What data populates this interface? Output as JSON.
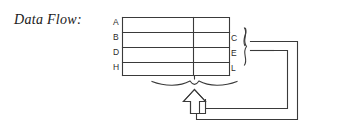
{
  "figure": {
    "caption": "Data Flow:",
    "type": "block-diagram"
  },
  "diagram": {
    "left_labels": [
      {
        "text": "A",
        "y": 22
      },
      {
        "text": "B",
        "y": 37
      },
      {
        "text": "D",
        "y": 52
      },
      {
        "text": "H",
        "y": 67
      }
    ],
    "right_labels": [
      {
        "text": "C",
        "y": 38
      },
      {
        "text": "E",
        "y": 53
      },
      {
        "text": "L",
        "y": 68
      }
    ],
    "brace_right": "}",
    "brace_bottom": "underbrace",
    "arrow": "up-arrow-outline",
    "feedback_loops": 2,
    "line_color": "#3a3a3a",
    "background_color": "#ffffff"
  }
}
